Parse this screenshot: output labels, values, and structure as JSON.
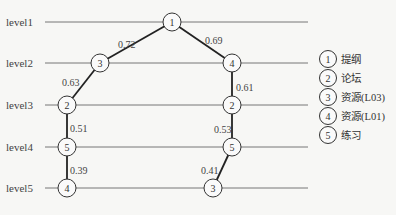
{
  "diagram": {
    "levels": [
      {
        "label": "level1",
        "y": 22
      },
      {
        "label": "level2",
        "y": 63
      },
      {
        "label": "level3",
        "y": 105
      },
      {
        "label": "level4",
        "y": 147
      },
      {
        "label": "level5",
        "y": 188
      }
    ],
    "nodes": [
      {
        "id": "a",
        "label": "1",
        "x": 172,
        "y": 22
      },
      {
        "id": "b",
        "label": "3",
        "x": 100,
        "y": 63
      },
      {
        "id": "c",
        "label": "4",
        "x": 232,
        "y": 63
      },
      {
        "id": "d",
        "label": "2",
        "x": 67,
        "y": 105
      },
      {
        "id": "e",
        "label": "2",
        "x": 232,
        "y": 105
      },
      {
        "id": "f",
        "label": "5",
        "x": 67,
        "y": 147
      },
      {
        "id": "g",
        "label": "5",
        "x": 232,
        "y": 147
      },
      {
        "id": "h",
        "label": "4",
        "x": 67,
        "y": 188
      },
      {
        "id": "i",
        "label": "3",
        "x": 213,
        "y": 188
      }
    ],
    "edges": [
      {
        "from": "a",
        "to": "b",
        "weight": "0.72",
        "lx": 118,
        "ly": 48
      },
      {
        "from": "a",
        "to": "c",
        "weight": "0.69",
        "lx": 205,
        "ly": 44
      },
      {
        "from": "b",
        "to": "d",
        "weight": "0.63",
        "lx": 62,
        "ly": 86
      },
      {
        "from": "c",
        "to": "e",
        "weight": "0.61",
        "lx": 236,
        "ly": 91
      },
      {
        "from": "d",
        "to": "f",
        "weight": "0.51",
        "lx": 70,
        "ly": 132
      },
      {
        "from": "e",
        "to": "g",
        "weight": "0.53",
        "lx": 214,
        "ly": 133
      },
      {
        "from": "f",
        "to": "h",
        "weight": "0.39",
        "lx": 70,
        "ly": 174
      },
      {
        "from": "g",
        "to": "i",
        "weight": "0.41",
        "lx": 201,
        "ly": 174
      }
    ],
    "legend": [
      {
        "num": "1",
        "text": "提纲"
      },
      {
        "num": "2",
        "text": "论坛"
      },
      {
        "num": "3",
        "text": "资源(L03)"
      },
      {
        "num": "4",
        "text": "资源(L01)"
      },
      {
        "num": "5",
        "text": "练习"
      }
    ]
  }
}
